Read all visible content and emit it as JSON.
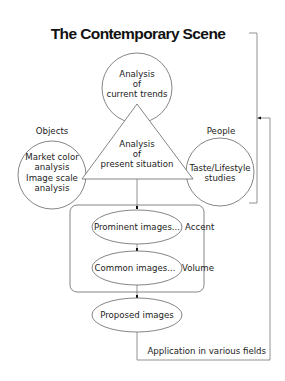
{
  "title": "The Contemporary Scene",
  "nodes": {
    "current_trends": {
      "lines": [
        "Analysis",
        "of",
        "current trends"
      ],
      "shape": "circle"
    },
    "present_situation": {
      "lines": [
        "Analysis",
        "of",
        "present situation"
      ],
      "shape": "triangle"
    },
    "objects": {
      "heading": "Objects",
      "lines": [
        "Market color",
        "analysis",
        "Image scale",
        "analysis"
      ],
      "shape": "circle"
    },
    "people": {
      "heading": "People",
      "lines": [
        "Taste/Lifestyle",
        "studies"
      ],
      "shape": "circle"
    },
    "prominent": {
      "label": "Prominent images...",
      "side_label": "Accent",
      "shape": "ellipse"
    },
    "common": {
      "label": "Common images...",
      "side_label": "Volume",
      "shape": "ellipse"
    },
    "proposed": {
      "label": "Proposed images",
      "shape": "ellipse"
    }
  },
  "feedback_label": "Application in various fields",
  "colors": {
    "stroke": "#666666",
    "text": "#222222",
    "background": "#ffffff"
  }
}
